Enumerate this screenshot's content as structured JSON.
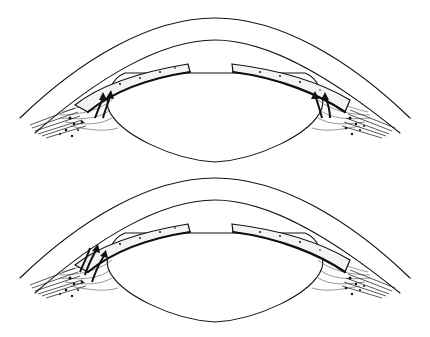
{
  "figure": {
    "panels": [
      {
        "id": "top",
        "offset_y": 0,
        "arrows": "left-up-right"
      },
      {
        "id": "bottom",
        "offset_y": 160,
        "arrows": "curved-left"
      }
    ],
    "colors": {
      "background": "#ffffff",
      "ink": "#111111"
    }
  }
}
